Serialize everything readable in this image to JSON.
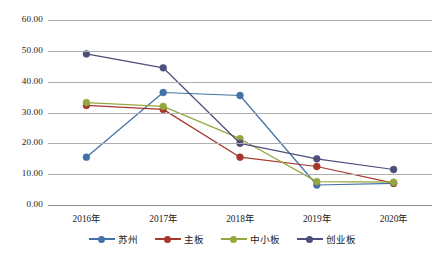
{
  "chart_data": {
    "type": "line",
    "title": "",
    "xlabel": "",
    "ylabel": "",
    "categories": [
      "2016年",
      "2017年",
      "2018年",
      "2019年",
      "2020年"
    ],
    "ylim": [
      0,
      60
    ],
    "yticks": [
      "0.00",
      "10.00",
      "20.00",
      "30.00",
      "40.00",
      "50.00",
      "60.00"
    ],
    "ytick_values": [
      0,
      10,
      20,
      30,
      40,
      50,
      60
    ],
    "grid": true,
    "legend_position": "bottom",
    "series": [
      {
        "name": "苏州",
        "color": "#4472a8",
        "values": [
          15.5,
          36.5,
          35.5,
          6.5,
          7.0
        ]
      },
      {
        "name": "主板",
        "color": "#a5372e",
        "values": [
          32.3,
          31.0,
          15.5,
          12.5,
          7.1
        ]
      },
      {
        "name": "中小板",
        "color": "#93a83f",
        "values": [
          33.2,
          32.0,
          21.5,
          7.6,
          7.4
        ]
      },
      {
        "name": "创业板",
        "color": "#4e4f7a",
        "values": [
          49.0,
          44.5,
          20.0,
          15.0,
          11.5
        ]
      }
    ]
  }
}
